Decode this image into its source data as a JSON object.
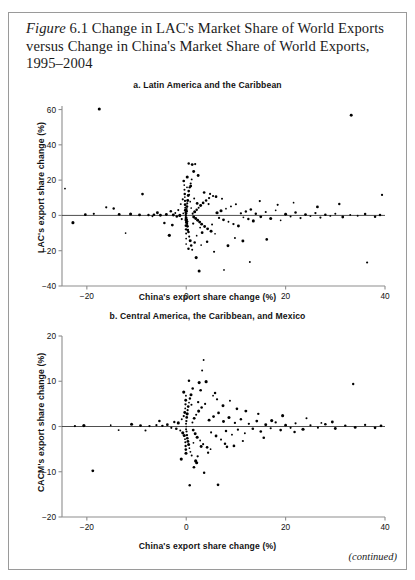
{
  "figure": {
    "label_italic": "Figure",
    "number": "6.1",
    "title_rest": "Change in LAC's Market Share of World Exports versus Change in China's Market Share of World Exports, 1995–2004",
    "continued_note": "(continued)",
    "border_color": "#9a9a9a",
    "text_color": "#1b1b1b",
    "point_color": "#000000"
  },
  "chart_data": [
    {
      "type": "scatter",
      "title": "a. Latin America and the Caribbean",
      "xlabel": "China's export share change (%)",
      "ylabel": "LAC's export share change (%)",
      "xlim": [
        -25,
        40
      ],
      "ylim": [
        -40,
        62
      ],
      "xticks": [
        -20,
        0,
        20,
        40
      ],
      "yticks": [
        -40,
        -20,
        0,
        20,
        40,
        60
      ],
      "xtick_labels": [
        "−20",
        "0",
        "20",
        "40"
      ],
      "ytick_labels": [
        "−40",
        "−20",
        "0",
        "20",
        "40",
        "60"
      ],
      "grid": false,
      "legend": "none",
      "reference_line_y": 0,
      "points": [
        [
          -17.5,
          60.3
        ],
        [
          -24.4,
          15.2
        ],
        [
          -22.8,
          -4.1
        ],
        [
          -16.1,
          4.6
        ],
        [
          -14.6,
          3.9
        ],
        [
          -12.2,
          -10.0
        ],
        [
          -8.8,
          12.1
        ],
        [
          -9.4,
          0.3
        ],
        [
          -7.6,
          0.2
        ],
        [
          -6.5,
          0.4
        ],
        [
          -5.2,
          0.1
        ],
        [
          -4.4,
          -4.3
        ],
        [
          -4.0,
          0.5
        ],
        [
          -3.4,
          -11.3
        ],
        [
          -3.1,
          2.3
        ],
        [
          -2.6,
          0.2
        ],
        [
          -2.2,
          1.4
        ],
        [
          -1.9,
          -0.6
        ],
        [
          -1.6,
          3.0
        ],
        [
          -1.3,
          0.0
        ],
        [
          -1.1,
          6.4
        ],
        [
          -0.9,
          -2.1
        ],
        [
          -0.7,
          9.1
        ],
        [
          -0.6,
          1.2
        ],
        [
          -0.5,
          19.5
        ],
        [
          -0.4,
          17.2
        ],
        [
          -0.35,
          14.5
        ],
        [
          -0.3,
          12.1
        ],
        [
          -0.28,
          10.4
        ],
        [
          -0.25,
          8.2
        ],
        [
          -0.22,
          6.1
        ],
        [
          -0.2,
          4.4
        ],
        [
          -0.18,
          2.9
        ],
        [
          -0.15,
          1.6
        ],
        [
          -0.12,
          0.7
        ],
        [
          -0.1,
          -0.3
        ],
        [
          -0.08,
          -1.4
        ],
        [
          -0.06,
          -2.6
        ],
        [
          -0.05,
          -4.1
        ],
        [
          -0.04,
          -5.8
        ],
        [
          -0.03,
          -7.9
        ],
        [
          -0.02,
          -10.2
        ],
        [
          -0.015,
          -13.1
        ],
        [
          -0.01,
          -16.2
        ],
        [
          0.0,
          0.0
        ],
        [
          0.02,
          1.1
        ],
        [
          0.04,
          -1.2
        ],
        [
          0.06,
          2.4
        ],
        [
          0.08,
          -2.3
        ],
        [
          0.1,
          3.6
        ],
        [
          0.12,
          -3.5
        ],
        [
          0.15,
          5.0
        ],
        [
          0.18,
          -4.8
        ],
        [
          0.2,
          6.8
        ],
        [
          0.25,
          -6.2
        ],
        [
          0.3,
          8.5
        ],
        [
          0.35,
          -8.1
        ],
        [
          0.4,
          11.3
        ],
        [
          0.45,
          -9.4
        ],
        [
          0.5,
          13.8
        ],
        [
          0.6,
          -12.0
        ],
        [
          0.7,
          15.9
        ],
        [
          0.8,
          -14.3
        ],
        [
          0.9,
          18.1
        ],
        [
          1.0,
          -17.0
        ],
        [
          1.1,
          20.4
        ],
        [
          1.2,
          -19.5
        ],
        [
          1.3,
          1.0
        ],
        [
          1.5,
          -0.9
        ],
        [
          1.7,
          2.1
        ],
        [
          1.9,
          -1.8
        ],
        [
          2.1,
          3.2
        ],
        [
          2.3,
          -2.7
        ],
        [
          2.5,
          4.4
        ],
        [
          2.7,
          -3.8
        ],
        [
          2.9,
          5.6
        ],
        [
          3.1,
          -5.0
        ],
        [
          3.4,
          7.1
        ],
        [
          3.7,
          -6.3
        ],
        [
          4.0,
          8.4
        ],
        [
          4.3,
          -7.6
        ],
        [
          4.6,
          9.8
        ],
        [
          5.0,
          -9.0
        ],
        [
          5.4,
          11.0
        ],
        [
          5.8,
          -10.4
        ],
        [
          6.2,
          1.5
        ],
        [
          6.6,
          -1.4
        ],
        [
          7.0,
          2.6
        ],
        [
          7.5,
          -2.5
        ],
        [
          8.0,
          3.8
        ],
        [
          8.5,
          -3.6
        ],
        [
          9.0,
          5.1
        ],
        [
          9.5,
          -4.9
        ],
        [
          10.0,
          6.3
        ],
        [
          10.5,
          -6.0
        ],
        [
          11.0,
          1.2
        ],
        [
          11.5,
          -1.1
        ],
        [
          12.0,
          2.2
        ],
        [
          12.5,
          -2.0
        ],
        [
          13.0,
          3.4
        ],
        [
          13.5,
          -3.1
        ],
        [
          14.0,
          0.9
        ],
        [
          15.0,
          -0.8
        ],
        [
          16.0,
          1.9
        ],
        [
          17.0,
          -1.7
        ],
        [
          18.0,
          2.9
        ],
        [
          19.0,
          -2.8
        ],
        [
          20.0,
          0.7
        ],
        [
          21.0,
          -0.6
        ],
        [
          22.0,
          1.6
        ],
        [
          23.0,
          -1.5
        ],
        [
          24.0,
          0.5
        ],
        [
          25.0,
          -0.4
        ],
        [
          26.0,
          1.3
        ],
        [
          27.0,
          -1.2
        ],
        [
          28.0,
          0.4
        ],
        [
          29.0,
          -0.3
        ],
        [
          30.0,
          1.0
        ],
        [
          31.5,
          -0.9
        ],
        [
          33.0,
          0.3
        ],
        [
          34.5,
          -0.2
        ],
        [
          36.0,
          0.8
        ],
        [
          38.0,
          -0.7
        ],
        [
          39.0,
          0.2
        ],
        [
          0.5,
          29.4
        ],
        [
          1.2,
          28.8
        ],
        [
          1.8,
          29.1
        ],
        [
          2.4,
          22.6
        ],
        [
          1.5,
          24.9
        ],
        [
          0.2,
          21.8
        ],
        [
          3.6,
          13.0
        ],
        [
          4.8,
          12.2
        ],
        [
          6.0,
          10.6
        ],
        [
          7.2,
          9.4
        ],
        [
          2.0,
          -23.9
        ],
        [
          2.6,
          -31.5
        ],
        [
          7.6,
          -30.9
        ],
        [
          8.4,
          -17.2
        ],
        [
          5.6,
          -20.6
        ],
        [
          11.4,
          -14.5
        ],
        [
          16.2,
          -13.6
        ],
        [
          12.8,
          -26.4
        ],
        [
          36.4,
          -26.7
        ],
        [
          30.8,
          6.5
        ],
        [
          26.4,
          4.8
        ],
        [
          21.6,
          7.2
        ],
        [
          18.4,
          6.0
        ],
        [
          14.8,
          8.1
        ],
        [
          33.2,
          56.8
        ],
        [
          39.4,
          11.6
        ],
        [
          9.8,
          -12.8
        ],
        [
          4.2,
          -14.9
        ],
        [
          3.0,
          -16.8
        ],
        [
          -2.8,
          -5.5
        ],
        [
          -5.8,
          1.5
        ],
        [
          -6.8,
          -0.5
        ],
        [
          -11.2,
          0.8
        ],
        [
          -13.5,
          0.6
        ],
        [
          -18.6,
          0.9
        ],
        [
          -20.3,
          0.4
        ],
        [
          1.0,
          4.2
        ],
        [
          1.4,
          -4.6
        ],
        [
          2.2,
          6.8
        ],
        [
          2.8,
          -6.9
        ],
        [
          0.8,
          7.8
        ],
        [
          0.3,
          -8.4
        ],
        [
          1.6,
          9.6
        ],
        [
          3.2,
          -9.8
        ],
        [
          0.6,
          11.8
        ],
        [
          2.1,
          -11.5
        ],
        [
          4.5,
          6.4
        ],
        [
          5.2,
          -5.2
        ],
        [
          0.15,
          15.9
        ],
        [
          0.45,
          -18.9
        ],
        [
          0.9,
          16.6
        ],
        [
          1.7,
          -15.4
        ]
      ]
    },
    {
      "type": "scatter",
      "title": "b. Central America, the Caribbean, and Mexico",
      "xlabel": "China's export share change (%)",
      "ylabel": "CACM's export share change (%)",
      "xlim": [
        -25,
        40
      ],
      "ylim": [
        -20,
        20
      ],
      "xticks": [
        -20,
        0,
        20,
        40
      ],
      "yticks": [
        -20,
        -10,
        0,
        10,
        20
      ],
      "xtick_labels": [
        "−20",
        "0",
        "20",
        "40"
      ],
      "ytick_labels": [
        "−20",
        "−10",
        "0",
        "10",
        "20"
      ],
      "grid": false,
      "legend": "none",
      "reference_line_y": 0,
      "points": [
        [
          -18.8,
          -9.8
        ],
        [
          -13.6,
          -0.8
        ],
        [
          -9.2,
          0.2
        ],
        [
          -7.4,
          0.1
        ],
        [
          -6.0,
          0.3
        ],
        [
          -4.8,
          0.15
        ],
        [
          -3.8,
          0.4
        ],
        [
          -3.0,
          -0.3
        ],
        [
          -2.4,
          1.0
        ],
        [
          -2.0,
          -0.5
        ],
        [
          -1.6,
          0.8
        ],
        [
          -1.2,
          -0.9
        ],
        [
          -0.9,
          1.6
        ],
        [
          -0.7,
          -1.4
        ],
        [
          -0.5,
          2.3
        ],
        [
          -0.4,
          -2.0
        ],
        [
          -0.3,
          3.1
        ],
        [
          -0.25,
          -2.8
        ],
        [
          -0.2,
          4.0
        ],
        [
          -0.18,
          -3.5
        ],
        [
          -0.15,
          4.9
        ],
        [
          -0.12,
          -4.3
        ],
        [
          -0.1,
          5.8
        ],
        [
          -0.08,
          -5.1
        ],
        [
          -0.06,
          6.8
        ],
        [
          -0.05,
          -5.9
        ],
        [
          -0.04,
          0.6
        ],
        [
          -0.03,
          -0.6
        ],
        [
          0.0,
          0.0
        ],
        [
          0.03,
          1.2
        ],
        [
          0.06,
          -1.1
        ],
        [
          0.1,
          2.0
        ],
        [
          0.14,
          -1.9
        ],
        [
          0.18,
          2.8
        ],
        [
          0.22,
          -2.6
        ],
        [
          0.28,
          3.6
        ],
        [
          0.34,
          -3.3
        ],
        [
          0.4,
          4.4
        ],
        [
          0.48,
          -4.0
        ],
        [
          0.56,
          5.3
        ],
        [
          0.64,
          -4.8
        ],
        [
          0.74,
          6.2
        ],
        [
          0.84,
          -5.6
        ],
        [
          0.96,
          7.0
        ],
        [
          1.1,
          -6.4
        ],
        [
          1.25,
          0.9
        ],
        [
          1.4,
          -0.8
        ],
        [
          1.6,
          1.8
        ],
        [
          1.8,
          -1.6
        ],
        [
          2.0,
          2.6
        ],
        [
          2.2,
          -2.4
        ],
        [
          2.5,
          3.4
        ],
        [
          2.8,
          -3.1
        ],
        [
          3.1,
          4.2
        ],
        [
          3.4,
          -3.9
        ],
        [
          3.8,
          5.0
        ],
        [
          4.2,
          -4.6
        ],
        [
          4.6,
          1.4
        ],
        [
          5.0,
          -1.3
        ],
        [
          5.5,
          2.2
        ],
        [
          6.0,
          -2.1
        ],
        [
          6.5,
          3.0
        ],
        [
          7.0,
          -2.9
        ],
        [
          7.5,
          1.1
        ],
        [
          8.0,
          -1.0
        ],
        [
          8.6,
          2.0
        ],
        [
          9.2,
          -1.8
        ],
        [
          9.8,
          0.8
        ],
        [
          10.4,
          -0.7
        ],
        [
          11.0,
          1.6
        ],
        [
          11.8,
          -1.5
        ],
        [
          12.6,
          0.6
        ],
        [
          13.4,
          -0.5
        ],
        [
          14.2,
          1.2
        ],
        [
          15.0,
          -1.1
        ],
        [
          16.0,
          0.4
        ],
        [
          17.0,
          -0.4
        ],
        [
          18.0,
          0.9
        ],
        [
          19.0,
          -0.8
        ],
        [
          20.0,
          0.3
        ],
        [
          21.0,
          -0.3
        ],
        [
          22.0,
          0.7
        ],
        [
          23.5,
          -0.6
        ],
        [
          25.0,
          0.25
        ],
        [
          26.5,
          -0.25
        ],
        [
          28.0,
          0.5
        ],
        [
          30.0,
          -0.45
        ],
        [
          32.0,
          0.2
        ],
        [
          34.0,
          -0.2
        ],
        [
          36.0,
          0.35
        ],
        [
          38.0,
          -0.3
        ],
        [
          39.2,
          0.15
        ],
        [
          3.5,
          14.7
        ],
        [
          3.2,
          12.4
        ],
        [
          2.6,
          9.7
        ],
        [
          4.0,
          9.9
        ],
        [
          2.9,
          8.0
        ],
        [
          5.4,
          6.8
        ],
        [
          6.2,
          6.0
        ],
        [
          8.8,
          5.7
        ],
        [
          7.4,
          4.6
        ],
        [
          10.2,
          3.9
        ],
        [
          12.0,
          3.4
        ],
        [
          14.5,
          2.8
        ],
        [
          3.6,
          -10.2
        ],
        [
          6.4,
          -12.9
        ],
        [
          4.4,
          -5.8
        ],
        [
          8.2,
          -4.5
        ],
        [
          9.6,
          -4.3
        ],
        [
          11.4,
          -3.2
        ],
        [
          1.9,
          -7.6
        ],
        [
          2.3,
          -6.6
        ],
        [
          33.6,
          9.4
        ],
        [
          29.4,
          1.0
        ],
        [
          24.2,
          1.8
        ],
        [
          19.4,
          2.4
        ],
        [
          15.6,
          -2.5
        ],
        [
          17.2,
          1.3
        ],
        [
          21.8,
          -1.2
        ],
        [
          27.2,
          0.8
        ],
        [
          -0.5,
          7.6
        ],
        [
          -1.0,
          -7.2
        ],
        [
          1.3,
          8.4
        ],
        [
          2.1,
          -8.0
        ],
        [
          0.55,
          10.1
        ],
        [
          1.55,
          -9.0
        ],
        [
          5.8,
          7.4
        ],
        [
          7.8,
          -3.8
        ],
        [
          -5.4,
          1.2
        ],
        [
          -8.2,
          -0.9
        ],
        [
          -11.0,
          0.5
        ],
        [
          -15.2,
          0.3
        ],
        [
          -20.6,
          0.2
        ],
        [
          -22.4,
          0.1
        ],
        [
          0.7,
          -13.0
        ],
        [
          4.9,
          -5.0
        ],
        [
          2.4,
          5.4
        ],
        [
          3.0,
          -4.4
        ],
        [
          1.05,
          4.8
        ],
        [
          1.45,
          -3.6
        ]
      ]
    }
  ]
}
